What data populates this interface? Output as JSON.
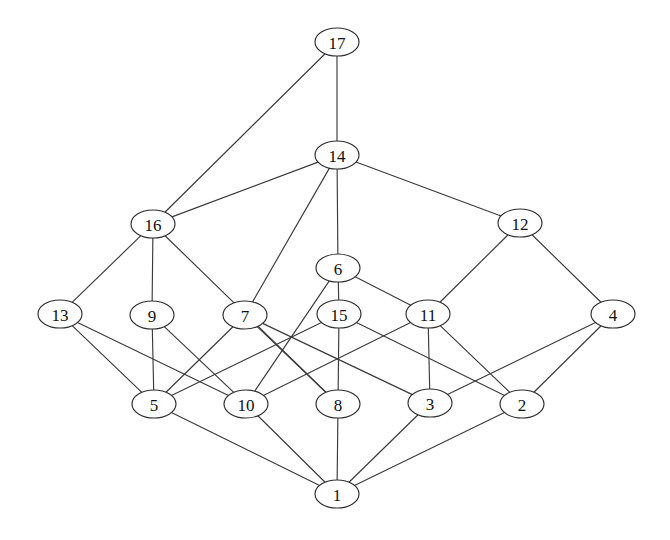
{
  "diagram": {
    "type": "hasse-diagram",
    "width": 670,
    "height": 540,
    "background_color": "#ffffff",
    "node_fill": "#ffffff",
    "node_stroke": "#2e2e2e",
    "edge_color": "#3a3a3a",
    "label_color": "#111111",
    "node_rx": 22,
    "node_ry": 14
  },
  "nodes": [
    {
      "id": "17",
      "label": "17",
      "x": 337,
      "y": 42,
      "level": 0
    },
    {
      "id": "14",
      "label": "14",
      "x": 337,
      "y": 155,
      "level": 1
    },
    {
      "id": "16",
      "label": "16",
      "x": 153,
      "y": 224,
      "level": 2
    },
    {
      "id": "12",
      "label": "12",
      "x": 520,
      "y": 223,
      "level": 2
    },
    {
      "id": "6",
      "label": "6",
      "x": 338,
      "y": 268,
      "level": 3
    },
    {
      "id": "13",
      "label": "13",
      "x": 60,
      "y": 314,
      "level": 4
    },
    {
      "id": "9",
      "label": "9",
      "x": 152,
      "y": 315,
      "level": 4
    },
    {
      "id": "7",
      "label": "7",
      "x": 245,
      "y": 315,
      "level": 4
    },
    {
      "id": "15",
      "label": "15",
      "x": 339,
      "y": 314,
      "level": 4
    },
    {
      "id": "11",
      "label": "11",
      "x": 428,
      "y": 314,
      "level": 4
    },
    {
      "id": "4",
      "label": "4",
      "x": 613,
      "y": 314,
      "level": 4
    },
    {
      "id": "5",
      "label": "5",
      "x": 154,
      "y": 404,
      "level": 5
    },
    {
      "id": "10",
      "label": "10",
      "x": 246,
      "y": 404,
      "level": 5
    },
    {
      "id": "8",
      "label": "8",
      "x": 338,
      "y": 404,
      "level": 5
    },
    {
      "id": "3",
      "label": "3",
      "x": 430,
      "y": 403,
      "level": 5
    },
    {
      "id": "2",
      "label": "2",
      "x": 522,
      "y": 404,
      "level": 5
    },
    {
      "id": "1",
      "label": "1",
      "x": 337,
      "y": 494,
      "level": 6
    }
  ],
  "edges": [
    {
      "from": "17",
      "to": "16"
    },
    {
      "from": "17",
      "to": "14"
    },
    {
      "from": "14",
      "to": "16"
    },
    {
      "from": "14",
      "to": "7"
    },
    {
      "from": "14",
      "to": "6"
    },
    {
      "from": "14",
      "to": "12"
    },
    {
      "from": "16",
      "to": "13"
    },
    {
      "from": "16",
      "to": "9"
    },
    {
      "from": "16",
      "to": "8"
    },
    {
      "from": "12",
      "to": "11"
    },
    {
      "from": "12",
      "to": "4"
    },
    {
      "from": "6",
      "to": "10"
    },
    {
      "from": "6",
      "to": "15"
    },
    {
      "from": "6",
      "to": "11"
    },
    {
      "from": "13",
      "to": "5"
    },
    {
      "from": "13",
      "to": "10"
    },
    {
      "from": "9",
      "to": "5"
    },
    {
      "from": "9",
      "to": "10"
    },
    {
      "from": "7",
      "to": "5"
    },
    {
      "from": "7",
      "to": "8"
    },
    {
      "from": "7",
      "to": "3"
    },
    {
      "from": "15",
      "to": "5"
    },
    {
      "from": "15",
      "to": "8"
    },
    {
      "from": "15",
      "to": "2"
    },
    {
      "from": "11",
      "to": "10"
    },
    {
      "from": "11",
      "to": "3"
    },
    {
      "from": "11",
      "to": "2"
    },
    {
      "from": "4",
      "to": "3"
    },
    {
      "from": "4",
      "to": "2"
    },
    {
      "from": "5",
      "to": "1"
    },
    {
      "from": "10",
      "to": "1"
    },
    {
      "from": "8",
      "to": "1"
    },
    {
      "from": "3",
      "to": "1"
    },
    {
      "from": "2",
      "to": "1"
    }
  ]
}
